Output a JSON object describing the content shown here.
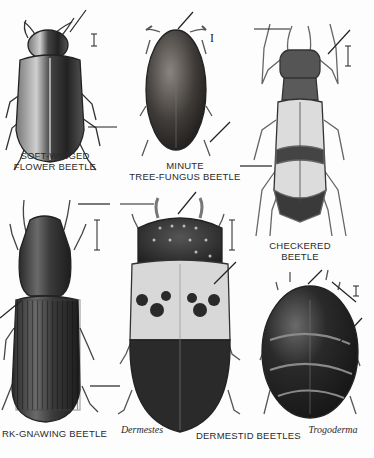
{
  "plate": {
    "background": "#fdfdfd",
    "ink": "#2a2a2a"
  },
  "labels": {
    "soft_winged_1": "SOFT-WINGED",
    "soft_winged_2": "FLOWER BEETLE",
    "tree_fungus_1": "MINUTE",
    "tree_fungus_2": "TREE-FUNGUS BEETLE",
    "checkered_1": "CHECKERED",
    "checkered_2": "BEETLE",
    "bark_gnawing": "RK-GNAWING BEETLE",
    "dermestes": "Dermestes",
    "dermestid": "DERMESTID BEETLES",
    "trogoderma": "Trogoderma"
  },
  "specimens": [
    {
      "name": "soft-winged flower beetle",
      "color": "#3a3a3a"
    },
    {
      "name": "minute tree-fungus beetle",
      "color": "#4a4540"
    },
    {
      "name": "checkered beetle",
      "color": "#8a8a8a"
    },
    {
      "name": "bark-gnawing beetle",
      "color": "#3c3c3c"
    },
    {
      "name": "Dermestes",
      "color": "#333333"
    },
    {
      "name": "Trogoderma",
      "color": "#2b2b2b"
    }
  ]
}
